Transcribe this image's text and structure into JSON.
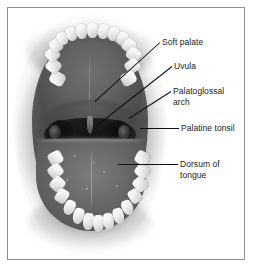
{
  "figure": {
    "type": "labeled anatomical photograph",
    "frame_color": "#8d8d8d",
    "background_color": "#ffffff",
    "text_color": "#1a1a1a",
    "leader_color": "#111111"
  },
  "labels": [
    {
      "id": "soft-palate",
      "lines": [
        "Soft palate"
      ],
      "text_x": 162,
      "text_y": 37,
      "leader": {
        "x1": 160,
        "y1": 42,
        "x2": 95,
        "y2": 101
      }
    },
    {
      "id": "uvula",
      "lines": [
        "Uvula"
      ],
      "text_x": 174,
      "text_y": 61,
      "leader": {
        "x1": 172,
        "y1": 66,
        "x2": 97,
        "y2": 125
      }
    },
    {
      "id": "palatoglossal-arch",
      "lines": [
        "Palatoglossal",
        "arch"
      ],
      "text_x": 173,
      "text_y": 86,
      "leader": {
        "x1": 171,
        "y1": 91,
        "x2": 129,
        "y2": 118
      }
    },
    {
      "id": "palatine-tonsil",
      "lines": [
        "Palatine tonsil"
      ],
      "text_x": 181,
      "text_y": 123,
      "leader": {
        "x1": 179,
        "y1": 128,
        "x2": 140,
        "y2": 128
      }
    },
    {
      "id": "dorsum-of-tongue",
      "lines": [
        "Dorsum of",
        "tongue"
      ],
      "text_x": 180,
      "text_y": 159,
      "leader": {
        "x1": 178,
        "y1": 164,
        "x2": 118,
        "y2": 164
      }
    }
  ],
  "structures": [
    {
      "id": "hard-palate",
      "name": "hard palate"
    },
    {
      "id": "soft-palate",
      "name": "soft palate"
    },
    {
      "id": "uvula",
      "name": "uvula"
    },
    {
      "id": "oropharynx",
      "name": "oropharynx"
    },
    {
      "id": "palatine-tonsil-left",
      "name": "left palatine tonsil"
    },
    {
      "id": "palatine-tonsil-right",
      "name": "right palatine tonsil"
    },
    {
      "id": "tongue",
      "name": "dorsum of tongue"
    },
    {
      "id": "upper-dental-arch",
      "name": "upper dental arch"
    },
    {
      "id": "lower-dental-arch",
      "name": "lower dental arch"
    }
  ],
  "upper_teeth": [
    {
      "x": 43,
      "y": 63,
      "w": 13,
      "h": 15,
      "r": -62,
      "kind": "molar"
    },
    {
      "x": 39,
      "y": 51,
      "w": 13,
      "h": 14,
      "r": -52,
      "kind": "molar"
    },
    {
      "x": 38,
      "y": 40,
      "w": 13,
      "h": 13,
      "r": -43,
      "kind": "molar"
    },
    {
      "x": 42,
      "y": 31,
      "w": 12,
      "h": 13,
      "r": -34,
      "kind": "molar"
    },
    {
      "x": 49,
      "y": 24,
      "w": 11,
      "h": 13,
      "r": -26,
      "kind": "incisor"
    },
    {
      "x": 58,
      "y": 19,
      "w": 11,
      "h": 14,
      "r": -18,
      "kind": "incisor"
    },
    {
      "x": 68,
      "y": 16,
      "w": 11,
      "h": 15,
      "r": -9,
      "kind": "incisor"
    },
    {
      "x": 79,
      "y": 15,
      "w": 11,
      "h": 15,
      "r": 0,
      "kind": "incisor"
    },
    {
      "x": 90,
      "y": 16,
      "w": 11,
      "h": 15,
      "r": 9,
      "kind": "incisor"
    },
    {
      "x": 100,
      "y": 19,
      "w": 11,
      "h": 14,
      "r": 18,
      "kind": "incisor"
    },
    {
      "x": 109,
      "y": 24,
      "w": 11,
      "h": 13,
      "r": 26,
      "kind": "incisor"
    },
    {
      "x": 115,
      "y": 31,
      "w": 12,
      "h": 13,
      "r": 34,
      "kind": "molar"
    },
    {
      "x": 119,
      "y": 40,
      "w": 13,
      "h": 13,
      "r": 43,
      "kind": "molar"
    },
    {
      "x": 118,
      "y": 51,
      "w": 13,
      "h": 14,
      "r": 52,
      "kind": "molar"
    },
    {
      "x": 114,
      "y": 63,
      "w": 13,
      "h": 15,
      "r": 62,
      "kind": "molar"
    }
  ],
  "lower_teeth": [
    {
      "x": 41,
      "y": 143,
      "w": 13,
      "h": 14,
      "r": 62,
      "kind": "molar"
    },
    {
      "x": 41,
      "y": 156,
      "w": 13,
      "h": 14,
      "r": 52,
      "kind": "molar"
    },
    {
      "x": 43,
      "y": 169,
      "w": 13,
      "h": 14,
      "r": 42,
      "kind": "molar"
    },
    {
      "x": 48,
      "y": 181,
      "w": 12,
      "h": 14,
      "r": 32,
      "kind": "molar"
    },
    {
      "x": 56,
      "y": 192,
      "w": 11,
      "h": 15,
      "r": 23,
      "kind": "incisor"
    },
    {
      "x": 65,
      "y": 200,
      "w": 11,
      "h": 16,
      "r": 15,
      "kind": "incisor"
    },
    {
      "x": 75,
      "y": 205,
      "w": 11,
      "h": 17,
      "r": 7,
      "kind": "incisor"
    },
    {
      "x": 85,
      "y": 207,
      "w": 11,
      "h": 17,
      "r": 0,
      "kind": "incisor"
    },
    {
      "x": 95,
      "y": 205,
      "w": 11,
      "h": 17,
      "r": -7,
      "kind": "incisor"
    },
    {
      "x": 105,
      "y": 200,
      "w": 11,
      "h": 16,
      "r": -15,
      "kind": "incisor"
    },
    {
      "x": 114,
      "y": 192,
      "w": 11,
      "h": 15,
      "r": -23,
      "kind": "incisor"
    },
    {
      "x": 121,
      "y": 181,
      "w": 12,
      "h": 14,
      "r": -32,
      "kind": "molar"
    },
    {
      "x": 126,
      "y": 169,
      "w": 13,
      "h": 14,
      "r": -42,
      "kind": "molar"
    },
    {
      "x": 128,
      "y": 156,
      "w": 13,
      "h": 14,
      "r": -52,
      "kind": "molar"
    },
    {
      "x": 128,
      "y": 143,
      "w": 13,
      "h": 14,
      "r": -62,
      "kind": "molar"
    }
  ]
}
